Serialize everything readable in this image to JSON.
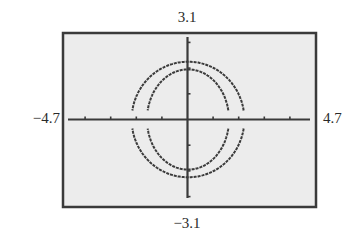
{
  "chart_data": {
    "type": "line",
    "title": "",
    "xlabel": "",
    "ylabel": "",
    "window": {
      "xmin": -4.7,
      "xmax": 4.7,
      "ymin": -3.1,
      "ymax": 3.1
    },
    "xlim": [
      -4.7,
      4.7
    ],
    "ylim": [
      -3.1,
      3.1
    ],
    "tick_labels": {
      "top": "3.1",
      "bottom": "−3.1",
      "left": "−4.7",
      "right": "4.7"
    },
    "x_ticks": [
      -4,
      -3,
      -2,
      -1,
      1,
      2,
      3,
      4
    ],
    "y_ticks": [
      -3,
      -2,
      -1,
      1,
      2,
      3
    ],
    "grid": false,
    "series": [
      {
        "name": "outer-ellipse",
        "shape": "ellipse",
        "center": [
          0,
          0
        ],
        "rx": 2.2,
        "ry": 2.25,
        "gap_near_x_axis": true
      },
      {
        "name": "inner-ellipse",
        "shape": "ellipse",
        "center": [
          0,
          0
        ],
        "rx": 1.6,
        "ry": 1.95,
        "gap_near_x_axis": true
      }
    ],
    "colors": {
      "plot_background": "#ececec",
      "frame": "#3a3a3a",
      "curve": "#3a3a3a",
      "page_background": "#ffffff"
    }
  }
}
